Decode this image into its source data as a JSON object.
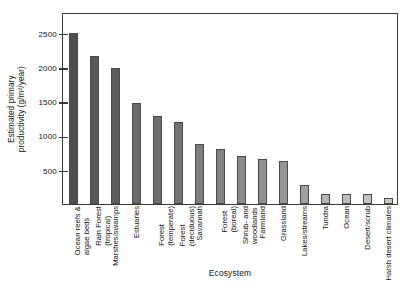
{
  "chart_data": {
    "type": "bar",
    "title": "",
    "xlabel": "Ecosystem",
    "ylabel_line1": "Estimated primary",
    "ylabel_line2": "productivity (g/m²/year)",
    "ylim": [
      0,
      2800
    ],
    "yticks": [
      500,
      1000,
      1500,
      2000,
      2500
    ],
    "ytick_labels": [
      "500",
      "1000",
      "1500",
      "2000",
      "2500"
    ],
    "grid": false,
    "legend": "none",
    "categories": [
      "Ocean reefs &\nalgae beds",
      "Rain Forest\n(tropical)",
      "Marshes/swamps",
      "Estuaries",
      "Forest\n(temperate)",
      "Forest\n(deciduous)",
      "Savannah",
      "Forest\n(boreal)",
      "Shrub- and\nwoodlands",
      "Farmland",
      "Grassland",
      "Lakes/streams",
      "Tundra",
      "Ocean",
      "Desert/scrub",
      "Harsh desert climates"
    ],
    "category_lines": [
      [
        "Ocean reefs &",
        "algae beds"
      ],
      [
        "Rain Forest",
        "(tropical)"
      ],
      [
        "Marshes/swamps"
      ],
      [
        "Estuaries"
      ],
      [
        "Forest",
        "(temperate)"
      ],
      [
        "Forest",
        "(deciduous)"
      ],
      [
        "Savannah"
      ],
      [
        "Forest",
        "(boreal)"
      ],
      [
        "Shrub- and",
        "woodlands"
      ],
      [
        "Farmland"
      ],
      [
        "Grassland"
      ],
      [
        "Lakes/streams"
      ],
      [
        "Tundra"
      ],
      [
        "Ocean"
      ],
      [
        "Desert/scrub"
      ],
      [
        "Harsh desert climates"
      ]
    ],
    "values": [
      2500,
      2160,
      1980,
      1480,
      1280,
      1200,
      880,
      800,
      700,
      650,
      630,
      280,
      150,
      140,
      145,
      90
    ],
    "bar_colors": [
      "#4e4e4e",
      "#585858",
      "#5c5c5c",
      "#6a6a6a",
      "#6f6f6f",
      "#737373",
      "#7e7e7e",
      "#828282",
      "#8b8b8b",
      "#909090",
      "#959595",
      "#a0a0a0",
      "#b4b4b4",
      "#bcbcbc",
      "#c2c2c2",
      "#c8c8c8"
    ]
  },
  "colors": {
    "frame": "#3a3a3a",
    "text": "#141414",
    "background": "#ffffff"
  }
}
